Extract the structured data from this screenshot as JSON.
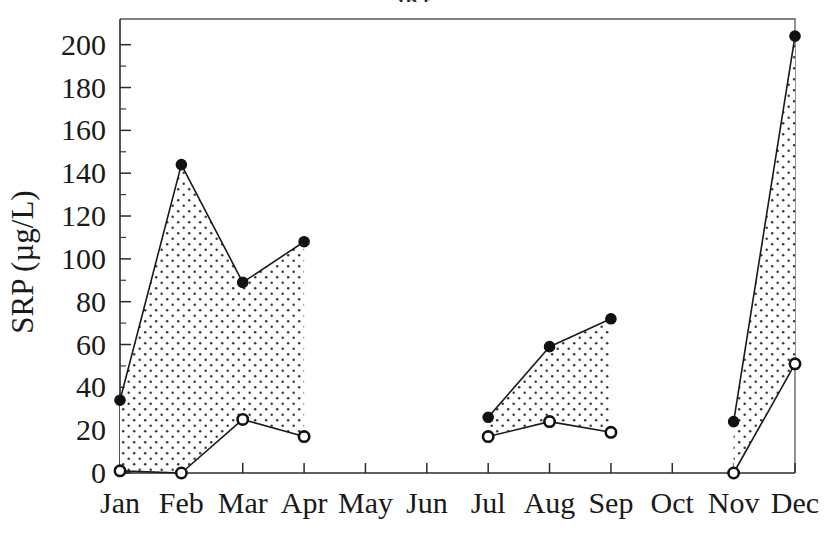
{
  "figure": {
    "background_color": "#ffffff",
    "ink_color": "#1a1a1a",
    "title_clipped": "SRP",
    "y_axis_label": "SRP (µg/L)",
    "x_axis_label": ""
  },
  "chart_data": {
    "type": "area",
    "title": "",
    "xlabel": "",
    "ylabel": "SRP (µg/L)",
    "categories": [
      "Jan",
      "Feb",
      "Mar",
      "Apr",
      "May",
      "Jun",
      "Jul",
      "Aug",
      "Sep",
      "Oct",
      "Nov",
      "Dec"
    ],
    "x_tick_labels": [
      "Jan",
      "Feb",
      "Mar",
      "Apr",
      "May",
      "Jun",
      "Jul",
      "Aug",
      "Sep",
      "Oct",
      "Nov",
      "Dec"
    ],
    "y_tick_labels": [
      "0",
      "20",
      "40",
      "60",
      "80",
      "100",
      "120",
      "140",
      "160",
      "180",
      "200"
    ],
    "y_ticks": [
      0,
      20,
      40,
      60,
      80,
      100,
      120,
      140,
      160,
      180,
      200
    ],
    "y_minor_ticks": [
      10,
      30,
      50,
      70,
      90,
      110,
      130,
      150,
      170,
      190
    ],
    "ylim": [
      0,
      212
    ],
    "grid": false,
    "legend": null,
    "legend_position": "none",
    "fill_between": true,
    "fill_pattern": "dotted-stipple",
    "fill_color": "#ffffff",
    "fill_dot_color": "#333333",
    "series": [
      {
        "name": "maximum",
        "marker": "filled-circle",
        "values": [
          34,
          144,
          89,
          108,
          null,
          null,
          26,
          59,
          72,
          null,
          24,
          204
        ]
      },
      {
        "name": "minimum",
        "marker": "open-circle",
        "values": [
          1,
          0,
          25,
          17,
          null,
          null,
          17,
          24,
          19,
          null,
          0,
          51
        ]
      }
    ],
    "gaps": [
      "May",
      "Jun",
      "Oct"
    ]
  },
  "axes": {
    "frame_visible": true,
    "y_tick_side": "right-of-axis",
    "x_tick_side": "below-axis"
  }
}
